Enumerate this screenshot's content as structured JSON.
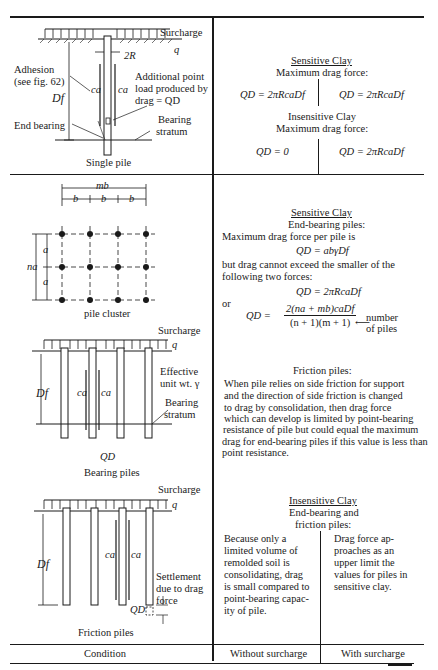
{
  "table": {
    "footer": {
      "condition": "Condition",
      "without_surcharge": "Without surcharge",
      "with_surcharge": "With surcharge"
    },
    "row1": {
      "figure": {
        "surcharge": "Surcharge",
        "q": "q",
        "two_r": "2R",
        "adhesion_line1": "Adhesion",
        "adhesion_line2": "(see fig. 62)",
        "ca_left": "ca",
        "ca_right": "ca",
        "df": "Df",
        "point_load_line1": "Additional point",
        "point_load_line2": "load produced by",
        "point_load_line3": "drag = QD",
        "end_bearing": "End bearing",
        "bearing_line1": "Bearing",
        "bearing_line2": "stratum",
        "caption": "Single pile"
      },
      "sensitive_title": "Sensitive Clay",
      "sensitive_sub": "Maximum drag force:",
      "sensitive_without": "QD = 2πRcaDf",
      "sensitive_with": "QD = 2πRcaDf",
      "insensitive_title": "Insensitive Clay",
      "insensitive_sub": "Maximum drag force:",
      "insensitive_without": "QD = 0",
      "insensitive_with": "QD = 2πRcaDf"
    },
    "row2": {
      "cluster": {
        "mb": "mb",
        "b": "b",
        "na": "na",
        "a": "a",
        "caption": "pile cluster"
      },
      "bearing_fig": {
        "surcharge": "Surcharge",
        "q": "q",
        "effective_line1": "Effective",
        "effective_line2": "unit wt. γ",
        "bearing_line1": "Bearing",
        "bearing_line2": "stratum",
        "df": "Df",
        "ca": "ca",
        "qd": "QD",
        "caption": "Bearing piles"
      },
      "friction_fig": {
        "surcharge": "Surcharge",
        "q": "q",
        "df": "Df",
        "ca": "ca",
        "qd": "QD",
        "settlement_line1": "Settlement",
        "settlement_line2": "due to drag",
        "settlement_line3": "force",
        "caption": "Friction piles"
      },
      "sensitive_title": "Sensitive Clay",
      "end_bearing_title": "End-bearing piles:",
      "max_drag_text": "Maximum drag force per pile is",
      "eq1": "QD = abγDf",
      "but_text_line1": "but drag cannot exceed the smaller of the",
      "but_text_line2": "following two forces:",
      "eq2": "QD = 2πRcaDf",
      "or": "or",
      "eq3_lhs": "QD =",
      "eq3_num": "2(na + mb)caDf",
      "eq3_den": "(n + 1)(m + 1)",
      "number_label_line1": "number",
      "number_label_line2": "of piles",
      "friction_title": "Friction piles:",
      "friction_text": [
        "When pile relies on side friction for support",
        "and the direction of side friction is changed",
        "to drag by consolidation, then drag force",
        "which can develop is limited by point-bearing",
        "resistance of pile but could equal the maximum",
        "drag for end-bearing piles if this value is less than",
        "point resistance."
      ],
      "insensitive_title": "Insensitive Clay",
      "insensitive_sub_line1": "End-bearing and",
      "insensitive_sub_line2": "friction piles:",
      "without_text": [
        "Because only a",
        "limited volume of",
        "remolded soil is",
        "consolidating, drag",
        "is small compared to",
        "point-bearing capac-",
        "ity of pile."
      ],
      "with_text": [
        "Drag force ap-",
        "proaches as an",
        "upper limit the",
        "values for piles in",
        "sensitive clay."
      ]
    }
  }
}
